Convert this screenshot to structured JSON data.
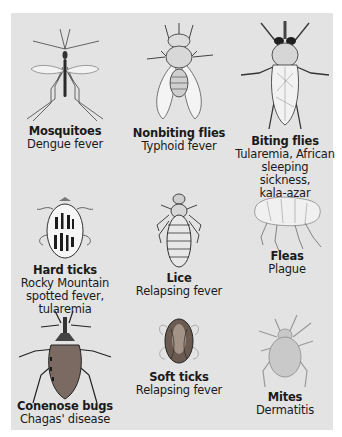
{
  "figure": {
    "background_color": "#e3e3e3",
    "vectors": [
      {
        "id": "mosquitoes",
        "name": "Mosquitoes",
        "disease": "Dengue fever",
        "icon": "mosquito-icon"
      },
      {
        "id": "nonbiting-flies",
        "name": "Nonbiting flies",
        "disease": "Typhoid fever",
        "icon": "housefly-icon"
      },
      {
        "id": "biting-flies",
        "name": "Biting flies",
        "disease_lines": [
          "Tularemia, African",
          "sleeping sickness,",
          "kala-azar"
        ],
        "icon": "horsefly-icon"
      },
      {
        "id": "hard-ticks",
        "name": "Hard ticks",
        "disease_lines": [
          "Rocky Mountain",
          "spotted fever,",
          "tularemia"
        ],
        "icon": "hard-tick-icon"
      },
      {
        "id": "lice",
        "name": "Lice",
        "disease": "Relapsing fever",
        "icon": "louse-icon"
      },
      {
        "id": "fleas",
        "name": "Fleas",
        "disease": "Plague",
        "icon": "flea-icon"
      },
      {
        "id": "conenose-bugs",
        "name": "Conenose bugs",
        "disease": "Chagas' disease",
        "icon": "conenose-bug-icon"
      },
      {
        "id": "soft-ticks",
        "name": "Soft ticks",
        "disease": "Relapsing fever",
        "icon": "soft-tick-icon"
      },
      {
        "id": "mites",
        "name": "Mites",
        "disease": "Dermatitis",
        "icon": "mite-icon"
      }
    ]
  }
}
